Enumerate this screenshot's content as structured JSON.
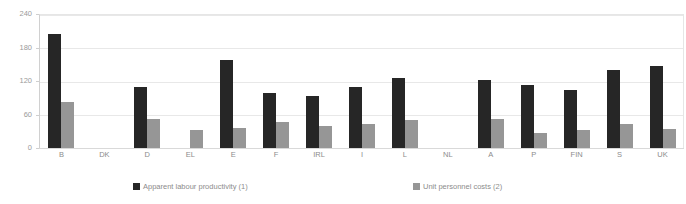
{
  "chart_data": {
    "type": "bar",
    "title": "",
    "subtitle": "",
    "xlabel": "",
    "ylabel": "",
    "ylim": [
      0,
      240
    ],
    "yticks": [
      0,
      60,
      120,
      180,
      240
    ],
    "grid": true,
    "legend_position": "bottom",
    "categories": [
      "B",
      "DK",
      "D",
      "EL",
      "E",
      "F",
      "IRL",
      "I",
      "L",
      "NL",
      "A",
      "P",
      "FIN",
      "S",
      "UK"
    ],
    "series": [
      {
        "name": "Apparent labour productivity (1)",
        "color": "#262626",
        "values": [
          204,
          null,
          109,
          null,
          158,
          99,
          93,
          109,
          125,
          null,
          122,
          113,
          104,
          140,
          147
        ]
      },
      {
        "name": "Unit personnel costs (2)",
        "color": "#969696",
        "values": [
          82,
          null,
          52,
          32,
          36,
          47,
          39,
          43,
          50,
          null,
          52,
          27,
          32,
          43,
          34
        ]
      }
    ]
  },
  "legend": {
    "items": [
      {
        "label": "Apparent labour productivity (1)",
        "color": "#262626"
      },
      {
        "label": "Unit personnel costs (2)",
        "color": "#969696"
      }
    ]
  },
  "axis": {
    "y_tick_labels": [
      "240",
      "180",
      "120",
      "60",
      "0"
    ]
  }
}
